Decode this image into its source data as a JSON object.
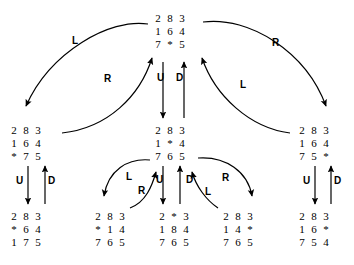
{
  "diagram": {
    "blank_symbol": "*",
    "stroke_color": "#000000",
    "background_color": "#ffffff"
  },
  "nodes": [
    {
      "id": "root",
      "label": "root",
      "x": 152,
      "y": 12,
      "rows": [
        [
          "2",
          "8",
          "3"
        ],
        [
          "1",
          "6",
          "4"
        ],
        [
          "7",
          "*",
          "5"
        ]
      ]
    },
    {
      "id": "n-left",
      "label": "left-child",
      "x": 8,
      "y": 124,
      "rows": [
        [
          "2",
          "8",
          "3"
        ],
        [
          "1",
          "6",
          "4"
        ],
        [
          "*",
          "7",
          "5"
        ]
      ]
    },
    {
      "id": "n-center",
      "label": "center-child",
      "x": 152,
      "y": 124,
      "rows": [
        [
          "2",
          "8",
          "3"
        ],
        [
          "1",
          "*",
          "4"
        ],
        [
          "7",
          "6",
          "5"
        ]
      ]
    },
    {
      "id": "n-right",
      "label": "right-child",
      "x": 296,
      "y": 124,
      "rows": [
        [
          "2",
          "8",
          "3"
        ],
        [
          "1",
          "6",
          "4"
        ],
        [
          "7",
          "5",
          "*"
        ]
      ]
    },
    {
      "id": "n-ll",
      "label": "left-leaf",
      "x": 8,
      "y": 210,
      "rows": [
        [
          "2",
          "8",
          "3"
        ],
        [
          "*",
          "6",
          "4"
        ],
        [
          "1",
          "7",
          "5"
        ]
      ]
    },
    {
      "id": "n-c1",
      "label": "center-leaf-1",
      "x": 92,
      "y": 210,
      "rows": [
        [
          "2",
          "8",
          "3"
        ],
        [
          "*",
          "1",
          "4"
        ],
        [
          "7",
          "6",
          "5"
        ]
      ]
    },
    {
      "id": "n-c2",
      "label": "center-leaf-2",
      "x": 156,
      "y": 210,
      "rows": [
        [
          "2",
          "*",
          "3"
        ],
        [
          "1",
          "8",
          "4"
        ],
        [
          "7",
          "6",
          "5"
        ]
      ]
    },
    {
      "id": "n-c3",
      "label": "center-leaf-3",
      "x": 220,
      "y": 210,
      "rows": [
        [
          "2",
          "8",
          "3"
        ],
        [
          "1",
          "4",
          "*"
        ],
        [
          "7",
          "6",
          "5"
        ]
      ]
    },
    {
      "id": "n-rr",
      "label": "right-leaf",
      "x": 296,
      "y": 210,
      "rows": [
        [
          "2",
          "8",
          "3"
        ],
        [
          "1",
          "6",
          "*"
        ],
        [
          "7",
          "5",
          "4"
        ]
      ]
    }
  ],
  "operators": [
    {
      "id": "op-root-left",
      "text": "L",
      "x": 72,
      "y": 36
    },
    {
      "id": "op-left-root",
      "text": "R",
      "x": 104,
      "y": 74
    },
    {
      "id": "op-root-down",
      "text": "U",
      "x": 157,
      "y": 73
    },
    {
      "id": "op-center-up",
      "text": "D",
      "x": 176,
      "y": 73
    },
    {
      "id": "op-root-right",
      "text": "R",
      "x": 272,
      "y": 38
    },
    {
      "id": "op-right-root",
      "text": "L",
      "x": 240,
      "y": 80
    },
    {
      "id": "op-left-down",
      "text": "U",
      "x": 16,
      "y": 176
    },
    {
      "id": "op-left-up",
      "text": "D",
      "x": 48,
      "y": 176
    },
    {
      "id": "op-center-l",
      "text": "L",
      "x": 126,
      "y": 172
    },
    {
      "id": "op-center-l-r",
      "text": "R",
      "x": 138,
      "y": 186
    },
    {
      "id": "op-center-u",
      "text": "U",
      "x": 156,
      "y": 175
    },
    {
      "id": "op-center-d",
      "text": "D",
      "x": 186,
      "y": 175
    },
    {
      "id": "op-center-r-l",
      "text": "L",
      "x": 205,
      "y": 187
    },
    {
      "id": "op-center-r",
      "text": "R",
      "x": 222,
      "y": 173
    },
    {
      "id": "op-right-down",
      "text": "U",
      "x": 303,
      "y": 176
    },
    {
      "id": "op-right-up",
      "text": "D",
      "x": 334,
      "y": 176
    }
  ],
  "edges": [
    {
      "id": "e-root-to-left",
      "kind": "curve",
      "d": "M 148 24 C 110 18, 50 52, 26 106",
      "arrow_at": "end"
    },
    {
      "id": "e-left-to-root",
      "kind": "curve",
      "d": "M 62 133 C 108 128, 140 96, 152 58",
      "arrow_at": "end"
    },
    {
      "id": "e-root-to-center",
      "kind": "line",
      "d": "M 163 62 L 163 118",
      "arrow_at": "end"
    },
    {
      "id": "e-center-to-root",
      "kind": "line",
      "d": "M 184 118 L 184 62",
      "arrow_at": "end"
    },
    {
      "id": "e-root-to-right",
      "kind": "curve",
      "d": "M 203 22 C 250 16, 306 52, 326 106",
      "arrow_at": "end"
    },
    {
      "id": "e-right-to-root",
      "kind": "curve",
      "d": "M 290 133 C 250 128, 215 96, 202 58",
      "arrow_at": "end"
    },
    {
      "id": "e-left-down",
      "kind": "line",
      "d": "M 28 166 L 28 204",
      "arrow_at": "end"
    },
    {
      "id": "e-left-up",
      "kind": "line",
      "d": "M 45 204 L 45 166",
      "arrow_at": "end"
    },
    {
      "id": "e-center-to-c1",
      "kind": "curve",
      "d": "M 150 160 C 128 158, 108 170, 104 196",
      "arrow_at": "end"
    },
    {
      "id": "e-c1-to-center",
      "kind": "curve",
      "d": "M 130 208 C 146 202, 152 186, 156 172",
      "arrow_at": "end"
    },
    {
      "id": "e-center-to-c2",
      "kind": "line",
      "d": "M 163 166 L 163 204",
      "arrow_at": "end"
    },
    {
      "id": "e-c2-to-center",
      "kind": "line",
      "d": "M 180 204 L 180 166",
      "arrow_at": "end"
    },
    {
      "id": "e-c3-to-center",
      "kind": "curve",
      "d": "M 218 208 C 206 200, 196 186, 192 172",
      "arrow_at": "end"
    },
    {
      "id": "e-center-to-c3",
      "kind": "curve",
      "d": "M 198 158 C 226 156, 248 172, 252 196",
      "arrow_at": "end"
    },
    {
      "id": "e-right-down",
      "kind": "line",
      "d": "M 315 166 L 315 204",
      "arrow_at": "end"
    },
    {
      "id": "e-right-up",
      "kind": "line",
      "d": "M 331 204 L 331 166",
      "arrow_at": "end"
    }
  ]
}
